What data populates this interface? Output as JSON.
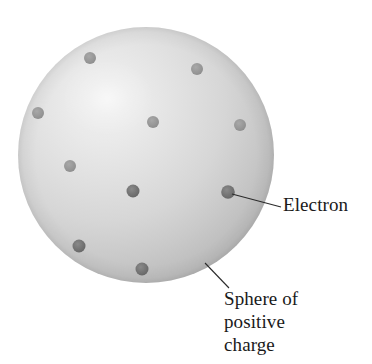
{
  "figure": {
    "type": "diagram",
    "background_color": "#ffffff",
    "sphere": {
      "name": "sphere-of-positive-charge",
      "center_x": 146,
      "center_y": 155,
      "radius": 128,
      "highlight_x": 108,
      "highlight_y": 98,
      "highlight_color": "#ededed",
      "mid_color": "#d3d3d3",
      "edge_color": "#b4b4b4",
      "rim_color": "#a9a9a9"
    },
    "electrons": [
      {
        "id": "electron-1",
        "cx": 90,
        "cy": 58,
        "r": 6.0,
        "color": "#9b9b9b"
      },
      {
        "id": "electron-2",
        "cx": 197,
        "cy": 69,
        "r": 6.0,
        "color": "#9d9d9d"
      },
      {
        "id": "electron-3",
        "cx": 38,
        "cy": 113,
        "r": 6.0,
        "color": "#a0a0a0"
      },
      {
        "id": "electron-4",
        "cx": 153,
        "cy": 122,
        "r": 6.0,
        "color": "#9a9a9a"
      },
      {
        "id": "electron-5",
        "cx": 240,
        "cy": 125,
        "r": 6.0,
        "color": "#9a9a9a"
      },
      {
        "id": "electron-6",
        "cx": 70,
        "cy": 166,
        "r": 6.0,
        "color": "#9e9e9e"
      },
      {
        "id": "electron-7",
        "cx": 133,
        "cy": 191,
        "r": 6.5,
        "color": "#8e8e8e"
      },
      {
        "id": "electron-8",
        "cx": 79,
        "cy": 246,
        "r": 6.5,
        "color": "#8b8b8b"
      },
      {
        "id": "electron-9",
        "cx": 142,
        "cy": 269,
        "r": 6.5,
        "color": "#8a8a8a"
      },
      {
        "id": "electron-10",
        "cx": 228,
        "cy": 192,
        "r": 6.5,
        "color": "#6f6f6f",
        "is_labeled": true
      }
    ],
    "leader_lines": [
      {
        "id": "electron-leader",
        "x1": 232,
        "y1": 194,
        "x2": 281,
        "y2": 207
      },
      {
        "id": "sphere-leader",
        "x1": 205,
        "y1": 263,
        "x2": 229,
        "y2": 288
      }
    ],
    "line_color": "#2b2b2b",
    "line_width": 1.1
  },
  "labels": {
    "electron": "Electron",
    "sphere_of_positive_charge": {
      "line1": "Sphere of",
      "line2": "positive",
      "line3": "charge"
    }
  }
}
